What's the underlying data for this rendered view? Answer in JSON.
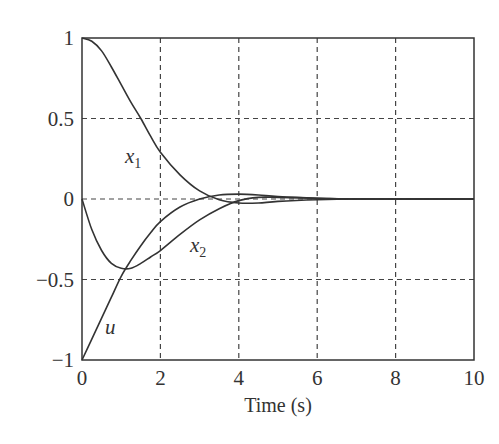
{
  "chart_data": {
    "type": "line",
    "title": "",
    "xlabel": "Time (s)",
    "ylabel": "",
    "xlim": [
      0,
      10
    ],
    "ylim": [
      -1,
      1
    ],
    "grid": true,
    "legend": "none (inline curve labels)",
    "xticks": [
      "0",
      "2",
      "4",
      "6",
      "8",
      "10"
    ],
    "yticks": [
      "1",
      "0.5",
      "0",
      "−0.5",
      "−1"
    ],
    "x": [
      0,
      0.25,
      0.5,
      0.75,
      1.0,
      1.25,
      1.5,
      1.75,
      2.0,
      2.5,
      3.0,
      3.5,
      4.0,
      4.5,
      5.0,
      6.0,
      7.0,
      8.0,
      10.0
    ],
    "series": [
      {
        "name": "x1",
        "label_main": "x",
        "label_sub": "1",
        "values": [
          1.0,
          0.98,
          0.92,
          0.82,
          0.71,
          0.6,
          0.5,
          0.39,
          0.29,
          0.15,
          0.05,
          -0.005,
          -0.025,
          -0.025,
          -0.015,
          -0.005,
          0.0,
          0.0,
          0.0
        ]
      },
      {
        "name": "x2",
        "label_main": "x",
        "label_sub": "2",
        "values": [
          0.0,
          -0.19,
          -0.32,
          -0.4,
          -0.43,
          -0.43,
          -0.4,
          -0.36,
          -0.32,
          -0.22,
          -0.13,
          -0.06,
          -0.01,
          0.01,
          0.01,
          0.005,
          0.0,
          0.0,
          0.0
        ]
      },
      {
        "name": "u",
        "label_main": "u",
        "label_sub": "",
        "values": [
          -1.0,
          -0.87,
          -0.74,
          -0.61,
          -0.48,
          -0.38,
          -0.29,
          -0.21,
          -0.14,
          -0.05,
          0.0,
          0.025,
          0.03,
          0.025,
          0.015,
          0.005,
          0.0,
          0.0,
          0.0
        ]
      }
    ],
    "annotations": [
      {
        "text": "x1",
        "x": 1.2,
        "y": 0.27
      },
      {
        "text": "x2",
        "x": 2.7,
        "y": -0.33
      },
      {
        "text": "u",
        "x": 0.6,
        "y": -0.82
      }
    ]
  }
}
